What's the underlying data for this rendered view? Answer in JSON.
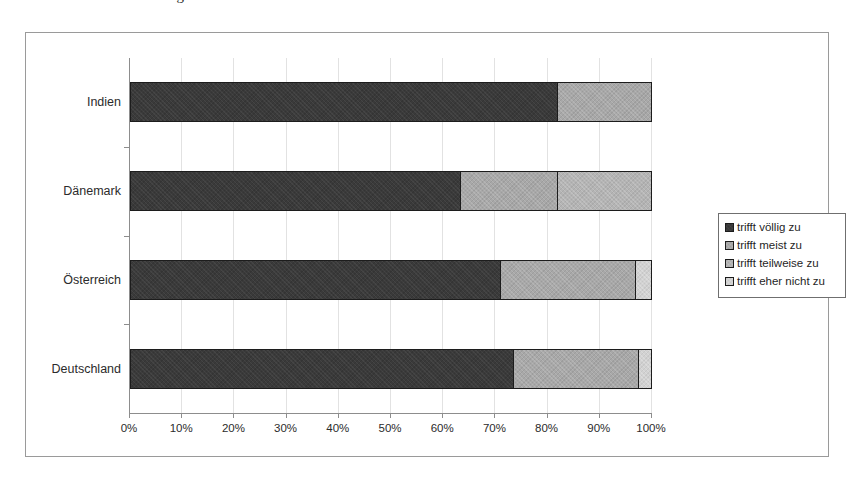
{
  "caption": {
    "text": "Abb. 5.5: Der das Managementfunktionen"
  },
  "legend": {
    "position": "right",
    "items": [
      {
        "label": "trifft völlig zu",
        "color": "#3a3a3a",
        "swatch_icon": "legend-swatch-icon"
      },
      {
        "label": "trifft meist zu",
        "color": "#a8a8a8",
        "swatch_icon": "legend-swatch-icon"
      },
      {
        "label": "trifft teilweise zu",
        "color": "#b4b4b4",
        "swatch_icon": "legend-swatch-icon"
      },
      {
        "label": "trifft eher nicht zu",
        "color": "#d2d2d2",
        "swatch_icon": "legend-swatch-icon"
      }
    ]
  },
  "chart_data": {
    "type": "bar",
    "orientation": "horizontal",
    "stacked": true,
    "normalized_percent": true,
    "title": "",
    "xlabel": "",
    "ylabel": "",
    "xlim": [
      0,
      100
    ],
    "grid": true,
    "legend_position": "right",
    "categories": [
      "Deutschland",
      "Österreich",
      "Dänemark",
      "Indien"
    ],
    "categories_top_to_bottom": [
      "Indien",
      "Dänemark",
      "Österreich",
      "Deutschland"
    ],
    "xticks": [
      0,
      10,
      20,
      30,
      40,
      50,
      60,
      70,
      80,
      90,
      100
    ],
    "xtick_labels": [
      "0%",
      "10%",
      "20%",
      "30%",
      "40%",
      "50%",
      "60%",
      "70%",
      "80%",
      "90%",
      "100%"
    ],
    "series": [
      {
        "name": "trifft völlig zu",
        "color": "#3a3a3a",
        "values": [
          73.5,
          71.0,
          63.5,
          82.0
        ]
      },
      {
        "name": "trifft meist zu",
        "color": "#a8a8a8",
        "values": [
          24.0,
          26.0,
          18.5,
          18.0
        ]
      },
      {
        "name": "trifft teilweise zu",
        "color": "#b4b4b4",
        "values": [
          0.0,
          0.0,
          18.0,
          0.0
        ]
      },
      {
        "name": "trifft eher nicht zu",
        "color": "#d2d2d2",
        "values": [
          2.5,
          3.0,
          0.0,
          0.0
        ]
      }
    ],
    "bars_top_to_bottom": [
      {
        "category": "Indien",
        "segments": [
          {
            "series": "trifft völlig zu",
            "value": 82.0,
            "color": "#3a3a3a"
          },
          {
            "series": "trifft meist zu",
            "value": 18.0,
            "color": "#a8a8a8"
          }
        ]
      },
      {
        "category": "Dänemark",
        "segments": [
          {
            "series": "trifft völlig zu",
            "value": 63.5,
            "color": "#3a3a3a"
          },
          {
            "series": "trifft meist zu",
            "value": 18.5,
            "color": "#a8a8a8"
          },
          {
            "series": "trifft teilweise zu",
            "value": 18.0,
            "color": "#b4b4b4"
          }
        ]
      },
      {
        "category": "Österreich",
        "segments": [
          {
            "series": "trifft völlig zu",
            "value": 71.0,
            "color": "#3a3a3a"
          },
          {
            "series": "trifft meist zu",
            "value": 26.0,
            "color": "#a8a8a8"
          },
          {
            "series": "trifft eher nicht zu",
            "value": 3.0,
            "color": "#d2d2d2"
          }
        ]
      },
      {
        "category": "Deutschland",
        "segments": [
          {
            "series": "trifft völlig zu",
            "value": 73.5,
            "color": "#3a3a3a"
          },
          {
            "series": "trifft meist zu",
            "value": 24.0,
            "color": "#a8a8a8"
          },
          {
            "series": "trifft eher nicht zu",
            "value": 2.5,
            "color": "#d2d2d2"
          }
        ]
      }
    ]
  }
}
